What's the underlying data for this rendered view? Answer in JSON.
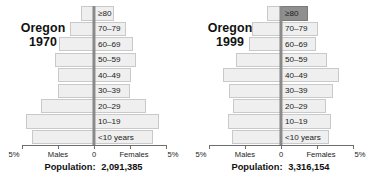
{
  "chart_data": [
    {
      "type": "bar",
      "title": "Oregon",
      "subtitle": "1970",
      "region": "Oregon",
      "year": "1970",
      "population_label": "Population:",
      "population_value": "2,091,385",
      "xlabel": "",
      "ylabel": "",
      "xlim": [
        -5,
        5
      ],
      "grid": false,
      "legend_position": "axis",
      "axis_left_label": "Males",
      "axis_center_label": "0",
      "axis_right_label": "Females",
      "axis_end_label_left": "5%",
      "axis_end_label_right": "5%",
      "tick_values": [
        -5,
        -2.5,
        0,
        2.5,
        5
      ],
      "categories": [
        "≥80",
        "70–79",
        "60–69",
        "50–59",
        "40–49",
        "30–39",
        "20–29",
        "10–19",
        "<10 years"
      ],
      "series": [
        {
          "name": "Males",
          "values": [
            0.9,
            1.7,
            2.4,
            2.7,
            2.5,
            2.5,
            3.7,
            4.7,
            4.3
          ]
        },
        {
          "name": "Females",
          "values": [
            1.4,
            2.2,
            2.7,
            2.9,
            2.6,
            2.5,
            3.6,
            4.5,
            4.1
          ]
        }
      ],
      "accent_bars": []
    },
    {
      "type": "bar",
      "title": "Oregon",
      "subtitle": "1999",
      "region": "Oregon",
      "year": "1999",
      "population_label": "Population:",
      "population_value": "3,316,154",
      "xlabel": "",
      "ylabel": "",
      "xlim": [
        -5,
        5
      ],
      "grid": false,
      "legend_position": "axis",
      "axis_left_label": "Males",
      "axis_center_label": "0",
      "axis_right_label": "Females",
      "axis_end_label_left": "5%",
      "axis_end_label_right": "5%",
      "tick_values": [
        -5,
        -2.5,
        0,
        2.5,
        5
      ],
      "categories": [
        "≥80",
        "70–79",
        "60–69",
        "50–59",
        "40–49",
        "30–39",
        "20–29",
        "10–19",
        "<10 years"
      ],
      "series": [
        {
          "name": "Males",
          "values": [
            1.0,
            2.0,
            2.2,
            3.1,
            4.0,
            3.6,
            3.3,
            3.7,
            3.4
          ]
        },
        {
          "name": "Females",
          "values": [
            1.9,
            2.6,
            2.4,
            3.2,
            4.0,
            3.6,
            3.1,
            3.5,
            3.3
          ]
        }
      ],
      "accent_bars": [
        {
          "category_index": 0,
          "side": "Females"
        }
      ]
    }
  ]
}
